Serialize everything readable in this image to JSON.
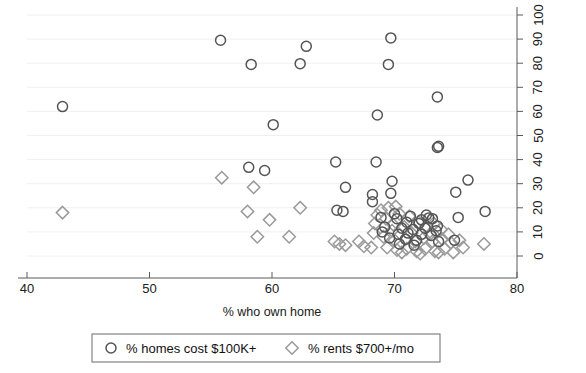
{
  "chart_data": {
    "type": "scatter",
    "title": "",
    "xlabel": "% who own home",
    "ylabel": "",
    "xlim": [
      40,
      80
    ],
    "ylim": [
      0,
      100
    ],
    "xticks": [
      40,
      50,
      60,
      70,
      80
    ],
    "yticks": [
      0,
      10,
      20,
      30,
      40,
      50,
      60,
      70,
      80,
      90,
      100
    ],
    "xtick_labels": [
      "40",
      "50",
      "60",
      "70",
      "80"
    ],
    "ytick_labels": [
      "0",
      "10",
      "20",
      "30",
      "40",
      "50",
      "60",
      "70",
      "80",
      "90",
      "100"
    ],
    "y_axis_position": "right",
    "y_tick_label_rotation": 90,
    "grid": true,
    "legend_position": "below",
    "colors": {
      "series_circles": "#555555",
      "series_diamonds": "#9a9a9a",
      "axis": "#5a5a5a",
      "grid": "#f0f0f0",
      "text": "#1a1a1a",
      "legend_border": "#6a6a6a",
      "background": "#ffffff"
    },
    "series": [
      {
        "name": "% homes cost $100K+",
        "marker": "circle",
        "color": "#555555",
        "points": [
          [
            42.9,
            62.0
          ],
          [
            55.8,
            89.5
          ],
          [
            58.3,
            79.5
          ],
          [
            62.3,
            79.8
          ],
          [
            62.8,
            87.0
          ],
          [
            69.7,
            90.5
          ],
          [
            69.5,
            79.5
          ],
          [
            73.5,
            66.0
          ],
          [
            68.6,
            58.5
          ],
          [
            60.1,
            54.5
          ],
          [
            73.6,
            45.5
          ],
          [
            73.5,
            45.0
          ],
          [
            65.2,
            39.0
          ],
          [
            68.5,
            39.0
          ],
          [
            58.1,
            36.8
          ],
          [
            59.4,
            35.5
          ],
          [
            69.8,
            31.0
          ],
          [
            76.0,
            31.5
          ],
          [
            66.0,
            28.5
          ],
          [
            68.2,
            25.5
          ],
          [
            69.7,
            26.0
          ],
          [
            75.0,
            26.5
          ],
          [
            68.2,
            22.5
          ],
          [
            65.3,
            19.0
          ],
          [
            65.8,
            18.5
          ],
          [
            77.4,
            18.5
          ],
          [
            71.3,
            16.5
          ],
          [
            75.2,
            16.0
          ],
          [
            70.2,
            15.5
          ],
          [
            72.2,
            15.0
          ],
          [
            72.8,
            15.8
          ],
          [
            73.1,
            15.5
          ],
          [
            71.0,
            14.0
          ],
          [
            72.0,
            13.5
          ],
          [
            73.5,
            12.5
          ],
          [
            69.2,
            12.0
          ],
          [
            70.6,
            11.5
          ],
          [
            71.5,
            11.0
          ],
          [
            72.5,
            11.5
          ],
          [
            73.4,
            10.5
          ],
          [
            69.0,
            10.0
          ],
          [
            70.3,
            9.0
          ],
          [
            71.1,
            9.5
          ],
          [
            72.2,
            9.0
          ],
          [
            73.0,
            8.5
          ],
          [
            69.6,
            7.5
          ],
          [
            70.9,
            7.0
          ],
          [
            71.8,
            6.5
          ],
          [
            73.6,
            6.0
          ],
          [
            74.9,
            6.5
          ],
          [
            70.4,
            5.0
          ],
          [
            71.6,
            4.5
          ],
          [
            68.9,
            16.0
          ],
          [
            70.0,
            17.5
          ],
          [
            72.6,
            17.0
          ]
        ]
      },
      {
        "name": "% rents $700+/mo",
        "marker": "diamond",
        "color": "#9a9a9a",
        "points": [
          [
            42.9,
            18.0
          ],
          [
            55.9,
            32.5
          ],
          [
            58.5,
            28.5
          ],
          [
            58.0,
            18.5
          ],
          [
            59.8,
            15.0
          ],
          [
            62.3,
            20.0
          ],
          [
            58.8,
            8.0
          ],
          [
            61.4,
            8.0
          ],
          [
            65.1,
            6.0
          ],
          [
            65.5,
            5.0
          ],
          [
            67.1,
            6.0
          ],
          [
            68.1,
            3.5
          ],
          [
            68.9,
            19.0
          ],
          [
            69.5,
            20.0
          ],
          [
            70.1,
            20.5
          ],
          [
            68.6,
            17.0
          ],
          [
            69.3,
            15.5
          ],
          [
            68.4,
            13.5
          ],
          [
            70.4,
            17.5
          ],
          [
            71.2,
            16.5
          ],
          [
            69.9,
            13.0
          ],
          [
            70.8,
            12.0
          ],
          [
            72.0,
            14.0
          ],
          [
            72.6,
            12.5
          ],
          [
            73.2,
            13.5
          ],
          [
            73.8,
            11.0
          ],
          [
            69.1,
            8.0
          ],
          [
            70.0,
            6.5
          ],
          [
            70.9,
            7.0
          ],
          [
            71.7,
            6.0
          ],
          [
            72.4,
            7.5
          ],
          [
            73.1,
            6.0
          ],
          [
            73.9,
            7.0
          ],
          [
            74.6,
            5.5
          ],
          [
            75.3,
            6.5
          ],
          [
            69.4,
            3.5
          ],
          [
            70.2,
            2.5
          ],
          [
            71.0,
            3.0
          ],
          [
            71.8,
            2.0
          ],
          [
            72.5,
            3.0
          ],
          [
            73.3,
            2.0
          ],
          [
            74.1,
            3.0
          ],
          [
            74.8,
            1.5
          ],
          [
            75.6,
            3.5
          ],
          [
            77.3,
            5.0
          ],
          [
            68.3,
            9.5
          ],
          [
            67.5,
            4.0
          ],
          [
            66.0,
            4.5
          ],
          [
            69.8,
            10.5
          ],
          [
            71.4,
            9.5
          ],
          [
            72.9,
            9.0
          ],
          [
            74.4,
            9.0
          ],
          [
            70.6,
            1.5
          ],
          [
            72.1,
            1.0
          ],
          [
            73.6,
            1.5
          ]
        ]
      }
    ]
  },
  "legend": {
    "entries": [
      {
        "label": "% homes cost $100K+",
        "marker": "circle-marker-icon"
      },
      {
        "label": "% rents $700+/mo",
        "marker": "diamond-marker-icon"
      }
    ]
  }
}
